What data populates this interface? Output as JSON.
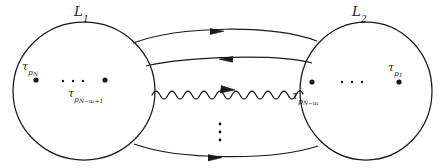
{
  "figure": {
    "type": "topological-diagram",
    "caption_absent": true,
    "background_color": "#ffffff",
    "stroke_color": "#1a1a1a",
    "loops": [
      {
        "id": "L1",
        "label": "L",
        "label_sub": "1",
        "side": "left",
        "center": {
          "cx": 84,
          "cy": 91
        },
        "radius": {
          "rx": 71,
          "ry": 69
        },
        "label_pos": {
          "x": 74,
          "y": 5
        },
        "marked_points": [
          {
            "id": "tau-p-N",
            "cx": 36,
            "cy": 80,
            "r": 2.6
          },
          {
            "id": "tau-p-N-uk-plus-1",
            "cx": 105,
            "cy": 80,
            "r": 2.6
          }
        ],
        "ellipsis_dots": [
          {
            "cx": 63,
            "cy": 81,
            "r": 1.2
          },
          {
            "cx": 73,
            "cy": 81,
            "r": 1.2
          },
          {
            "cx": 83,
            "cy": 81,
            "r": 1.2
          }
        ],
        "point_labels": [
          {
            "id": "tau-p-N-label",
            "tau": "τ",
            "sub": "p",
            "sub2": "N",
            "x": 22,
            "y": 61
          },
          {
            "id": "tau-p-N-uk-plus-1-label",
            "tau": "τ",
            "sub": "p",
            "sub2": "N−uₖ+1",
            "x": 68,
            "y": 88
          }
        ]
      },
      {
        "id": "L2",
        "label": "L",
        "label_sub": "2",
        "side": "right",
        "center": {
          "cx": 366,
          "cy": 91
        },
        "radius": {
          "rx": 66,
          "ry": 69
        },
        "label_pos": {
          "x": 352,
          "y": 5
        },
        "marked_points": [
          {
            "id": "tau-p-N-uk",
            "cx": 312,
            "cy": 82,
            "r": 2.6
          },
          {
            "id": "tau-p-1",
            "cx": 399,
            "cy": 82,
            "r": 2.6
          }
        ],
        "ellipsis_dots": [
          {
            "cx": 342,
            "cy": 82,
            "r": 1.2
          },
          {
            "cx": 352,
            "cy": 82,
            "r": 1.2
          },
          {
            "cx": 362,
            "cy": 82,
            "r": 1.2
          }
        ],
        "point_labels": [
          {
            "id": "tau-p-N-uk-label",
            "tau": "τ",
            "sub": "p",
            "sub2": "N−uₖ",
            "x": 292,
            "y": 90
          },
          {
            "id": "tau-p-1-label",
            "tau": "τ",
            "sub": "p",
            "sub2": "1",
            "x": 388,
            "y": 62
          }
        ]
      }
    ],
    "connectors": [
      {
        "id": "connector-top",
        "style": "smooth",
        "direction": "right",
        "arrow_at": {
          "x": 219,
          "y": 31
        },
        "path": "M 133 43 C 180 26, 270 24, 317 41"
      },
      {
        "id": "connector-second",
        "style": "smooth",
        "direction": "left",
        "arrow_at": {
          "x": 226,
          "y": 60
        },
        "path": "M 146 66 C 190 56, 278 54, 312 63"
      },
      {
        "id": "connector-wavy",
        "style": "wavy",
        "direction": "right",
        "arrow_at": {
          "x": 231,
          "y": 91
        },
        "y_center": 93,
        "x_start": 152,
        "x_end": 303,
        "amplitude": 4.2,
        "wavelength": 16
      },
      {
        "id": "connector-bottom",
        "style": "smooth",
        "direction": "right",
        "arrow_at": {
          "x": 216,
          "y": 158
        },
        "path": "M 134 144 C 178 160, 272 161, 318 146"
      }
    ],
    "vertical_ellipsis": {
      "id": "vertical-ellipsis",
      "glyph": "⋮",
      "dots": [
        {
          "cx": 220,
          "cy": 124,
          "r": 1.4
        },
        {
          "cx": 220,
          "cy": 132,
          "r": 1.4
        },
        {
          "cx": 220,
          "cy": 140,
          "r": 1.4
        }
      ]
    }
  }
}
